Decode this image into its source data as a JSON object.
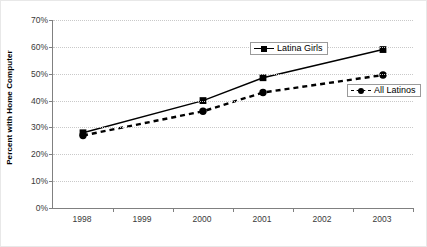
{
  "chart_data": {
    "type": "line",
    "title": "",
    "xlabel": "",
    "ylabel": "Percent with Home Computer",
    "categories": [
      "1998",
      "1999",
      "2000",
      "2001",
      "2002",
      "2003"
    ],
    "ylim": [
      0,
      70
    ],
    "ytick_labels": [
      "0%",
      "10%",
      "20%",
      "30%",
      "40%",
      "50%",
      "60%",
      "70%"
    ],
    "ytick_values": [
      0,
      10,
      20,
      30,
      40,
      50,
      60,
      70
    ],
    "grid": true,
    "legend_position": "inside-plot",
    "series": [
      {
        "name": "Latina Girls",
        "marker": "square",
        "line_style": "solid",
        "color": "#000000",
        "x": [
          "1998",
          "2000",
          "2001",
          "2003"
        ],
        "values": [
          28,
          40,
          48.5,
          59
        ]
      },
      {
        "name": "All Latinos",
        "marker": "circle",
        "line_style": "dashed",
        "color": "#000000",
        "x": [
          "1998",
          "2000",
          "2001",
          "2003"
        ],
        "values": [
          27,
          36,
          43,
          49.5
        ]
      }
    ]
  },
  "legend": {
    "latina_girls": "Latina Girls",
    "all_latinos": "All Latinos"
  }
}
